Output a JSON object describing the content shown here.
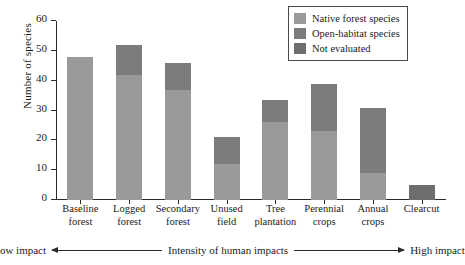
{
  "chart_data": {
    "type": "bar",
    "stacked": true,
    "title": "",
    "xlabel": "Intensity of human impacts",
    "ylabel": "Number of species",
    "ylim": [
      0,
      60
    ],
    "yticks": [
      0,
      10,
      20,
      30,
      40,
      50,
      60
    ],
    "grid": false,
    "legend_position": "top-right",
    "categories": [
      "Baseline forest",
      "Logged forest",
      "Secondary forest",
      "Unused field",
      "Tree plantation",
      "Perennial crops",
      "Annual crops",
      "Clearcut"
    ],
    "category_lines": [
      [
        "Baseline",
        "forest"
      ],
      [
        "Logged",
        "forest"
      ],
      [
        "Secondary",
        "forest"
      ],
      [
        "Unused",
        "field"
      ],
      [
        "Tree",
        "plantation"
      ],
      [
        "Perennial",
        "crops"
      ],
      [
        "Annual",
        "crops"
      ],
      [
        "Clearcut"
      ]
    ],
    "series": [
      {
        "name": "Native forest species",
        "color": "#9a9a9a",
        "values": [
          48,
          42,
          37,
          12,
          26,
          23,
          9,
          0
        ]
      },
      {
        "name": "Open-habitat species",
        "color": "#7c7c7c",
        "values": [
          0,
          10,
          9,
          9,
          7.5,
          16,
          22,
          0
        ]
      },
      {
        "name": "Not evaluated",
        "color": "#6e6e6e",
        "values": [
          0,
          0,
          0,
          0,
          0,
          0,
          0,
          5
        ]
      }
    ],
    "totals": [
      48,
      52,
      46,
      21,
      33.5,
      39,
      31,
      5
    ]
  },
  "legend": {
    "items": [
      {
        "label": "Native forest species",
        "color": "#9a9a9a"
      },
      {
        "label": "Open-habitat species",
        "color": "#7c7c7c"
      },
      {
        "label": "Not evaluated",
        "color": "#6e6e6e"
      }
    ]
  },
  "impact_axis": {
    "low": "Low impact",
    "center": "Intensity of human impacts",
    "high": "High impact"
  }
}
